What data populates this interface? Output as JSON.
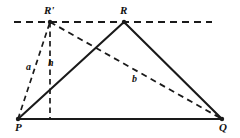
{
  "figure": {
    "background_color": "#ffffff",
    "stroke_color": "#1a1a1a",
    "vertices": {
      "P": {
        "label": "P",
        "x": 18,
        "y": 119
      },
      "Q": {
        "label": "Q",
        "x": 222,
        "y": 119
      },
      "R": {
        "label": "R",
        "x": 124,
        "y": 22
      },
      "R_prime": {
        "label": "R'",
        "x": 50,
        "y": 22
      },
      "foot": {
        "label": "",
        "x": 50,
        "y": 119
      }
    },
    "segment_labels": {
      "a": "a",
      "h": "h",
      "b": "b"
    },
    "solid_segments": [
      {
        "name": "base-PQ",
        "x1": 18,
        "y1": 119,
        "x2": 222,
        "y2": 119
      },
      {
        "name": "side-PR",
        "x1": 18,
        "y1": 119,
        "x2": 124,
        "y2": 22
      },
      {
        "name": "side-RQ",
        "x1": 124,
        "y1": 22,
        "x2": 222,
        "y2": 119
      }
    ],
    "dashed_segments": [
      {
        "name": "parallel-line",
        "x1": 14,
        "y1": 22,
        "x2": 212,
        "y2": 22
      },
      {
        "name": "side-a-PRprime",
        "x1": 18,
        "y1": 119,
        "x2": 50,
        "y2": 22
      },
      {
        "name": "altitude-h",
        "x1": 50,
        "y1": 22,
        "x2": 50,
        "y2": 119
      },
      {
        "name": "side-b-RprimeQ",
        "x1": 50,
        "y1": 22,
        "x2": 222,
        "y2": 119
      }
    ]
  }
}
